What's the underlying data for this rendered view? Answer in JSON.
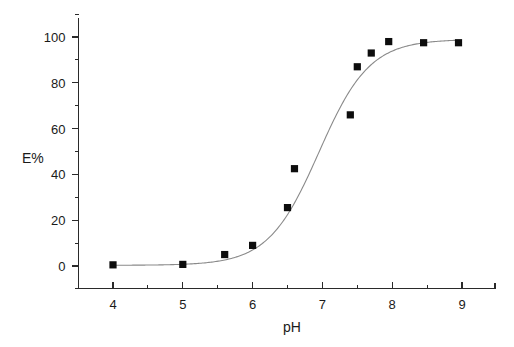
{
  "chart_data": {
    "type": "scatter",
    "title": "",
    "subtitle": "",
    "xlabel": "pH",
    "ylabel": "E%",
    "xlim": [
      3.55,
      9.5
    ],
    "ylim": [
      -9,
      112
    ],
    "grid": false,
    "legend": null,
    "x_ticks_major": [
      4,
      5,
      6,
      7,
      8,
      9
    ],
    "x_tick_labels": [
      "4",
      "5",
      "6",
      "7",
      "8",
      "9"
    ],
    "x_ticks_minor": [
      4.5,
      5.5,
      6.5,
      7.5,
      8.5
    ],
    "y_ticks_major": [
      0,
      20,
      40,
      60,
      80,
      100
    ],
    "y_tick_labels": [
      "0",
      "20",
      "40",
      "60",
      "80",
      "100"
    ],
    "y_ticks_minor": [
      10,
      30,
      50,
      70,
      90
    ],
    "series": [
      {
        "name": "E%",
        "marker": "square",
        "marker_color": "#0d0d0d",
        "points": [
          {
            "x": 4.0,
            "y": 0.5
          },
          {
            "x": 5.0,
            "y": 0.7
          },
          {
            "x": 5.6,
            "y": 5.0
          },
          {
            "x": 6.0,
            "y": 9.0
          },
          {
            "x": 6.5,
            "y": 25.5
          },
          {
            "x": 6.6,
            "y": 42.5
          },
          {
            "x": 7.4,
            "y": 66.0
          },
          {
            "x": 7.5,
            "y": 87.0
          },
          {
            "x": 7.7,
            "y": 93.0
          },
          {
            "x": 7.95,
            "y": 98.0
          },
          {
            "x": 8.45,
            "y": 97.5
          },
          {
            "x": 8.95,
            "y": 97.5
          }
        ]
      }
    ],
    "fit": {
      "name": "sigmoid fit",
      "color": "#8a8a8a",
      "model": "logistic",
      "midpoint_pH": 6.95,
      "slope": 1.45,
      "bottom": 0.3,
      "top": 99.0,
      "x_start": 4.0,
      "x_end": 8.9
    }
  },
  "axis": {
    "x_title": "pH",
    "y_title": "E%"
  }
}
